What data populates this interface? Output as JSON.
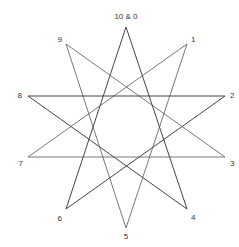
{
  "diagram": {
    "type": "star-polygon",
    "vertices": [
      {
        "id": "0",
        "label": "10 & 0",
        "x": 126,
        "y": 27,
        "lx": 126,
        "ly": 19,
        "anchor": "middle"
      },
      {
        "id": "1",
        "label": "1",
        "x": 187,
        "y": 44,
        "lx": 191,
        "ly": 42,
        "anchor": "start"
      },
      {
        "id": "2",
        "label": "2",
        "x": 225,
        "y": 96,
        "lx": 230,
        "ly": 98,
        "anchor": "start"
      },
      {
        "id": "3",
        "label": "3",
        "x": 225,
        "y": 157,
        "lx": 230,
        "ly": 166,
        "anchor": "start"
      },
      {
        "id": "4",
        "label": "4",
        "x": 187,
        "y": 209,
        "lx": 191,
        "ly": 220,
        "anchor": "start"
      },
      {
        "id": "5",
        "label": "5",
        "x": 126,
        "y": 228,
        "lx": 126,
        "ly": 239,
        "anchor": "middle"
      },
      {
        "id": "6",
        "label": "6",
        "x": 66,
        "y": 209,
        "lx": 62,
        "ly": 221,
        "anchor": "end"
      },
      {
        "id": "7",
        "label": "7",
        "x": 28,
        "y": 157,
        "lx": 23,
        "ly": 166,
        "anchor": "end"
      },
      {
        "id": "8",
        "label": "8",
        "x": 28,
        "y": 96,
        "lx": 22,
        "ly": 98,
        "anchor": "end"
      },
      {
        "id": "9",
        "label": "9",
        "x": 66,
        "y": 44,
        "lx": 62,
        "ly": 42,
        "anchor": "end"
      }
    ],
    "edges": [
      [
        "0",
        "4"
      ],
      [
        "4",
        "8"
      ],
      [
        "8",
        "2"
      ],
      [
        "2",
        "6"
      ],
      [
        "6",
        "0"
      ],
      [
        "1",
        "5"
      ],
      [
        "5",
        "9"
      ],
      [
        "9",
        "3"
      ],
      [
        "3",
        "7"
      ],
      [
        "7",
        "1"
      ]
    ],
    "dark_edges": [
      [
        "0",
        "4"
      ],
      [
        "4",
        "8"
      ],
      [
        "8",
        "2"
      ],
      [
        "2",
        "6"
      ],
      [
        "6",
        "0"
      ]
    ],
    "colors": {
      "line": "#555555",
      "text": "#333333",
      "background": "#ffffff"
    }
  }
}
